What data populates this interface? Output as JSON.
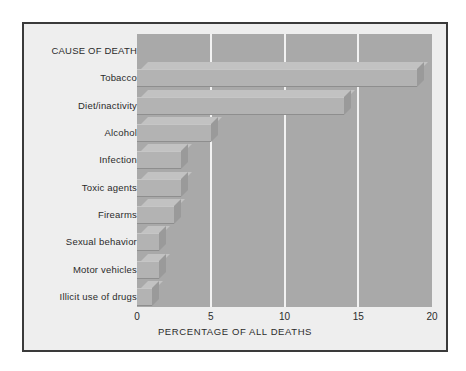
{
  "chart_data": {
    "type": "bar",
    "orientation": "horizontal",
    "style": "3d-bar",
    "title": "",
    "xlabel": "PERCENTAGE OF ALL DEATHS",
    "ylabel": "",
    "categories": [
      "CAUSE OF DEATH",
      "Tobacco",
      "Diet/inactivity",
      "Alcohol",
      "Infection",
      "Toxic agents",
      "Firearms",
      "Sexual behavior",
      "Motor vehicles",
      "Illicit use of drugs"
    ],
    "values": [
      null,
      19,
      14,
      5,
      3,
      3,
      2.5,
      1.5,
      1.5,
      1
    ],
    "bars": [
      {
        "label": "CAUSE OF DEATH",
        "value": null,
        "is_header": true
      },
      {
        "label": "Tobacco",
        "value": 19,
        "is_header": false
      },
      {
        "label": "Diet/inactivity",
        "value": 14,
        "is_header": false
      },
      {
        "label": "Alcohol",
        "value": 5,
        "is_header": false
      },
      {
        "label": "Infection",
        "value": 3,
        "is_header": false
      },
      {
        "label": "Toxic agents",
        "value": 3,
        "is_header": false
      },
      {
        "label": "Firearms",
        "value": 2.5,
        "is_header": false
      },
      {
        "label": "Sexual behavior",
        "value": 1.5,
        "is_header": false
      },
      {
        "label": "Motor vehicles",
        "value": 1.5,
        "is_header": false
      },
      {
        "label": "Illicit use of drugs",
        "value": 1,
        "is_header": false
      }
    ],
    "xlim": [
      0,
      20
    ],
    "xticks": [
      0,
      5,
      10,
      15,
      20
    ],
    "xtick_labels": [
      "0",
      "5",
      "10",
      "15",
      "20"
    ],
    "gridlines_at": [
      5,
      10,
      15
    ],
    "grid": true,
    "legend": null,
    "colors": {
      "plot_background": "#a9a9a9",
      "bar_front": "#b3b3b3",
      "bar_top": "#c2c2c2",
      "bar_side": "#9a9a9a",
      "gridline": "#f2f2f2",
      "frame_border": "#3a3a3a",
      "paper": "#eeeeee",
      "text": "#2b2b2b"
    }
  }
}
